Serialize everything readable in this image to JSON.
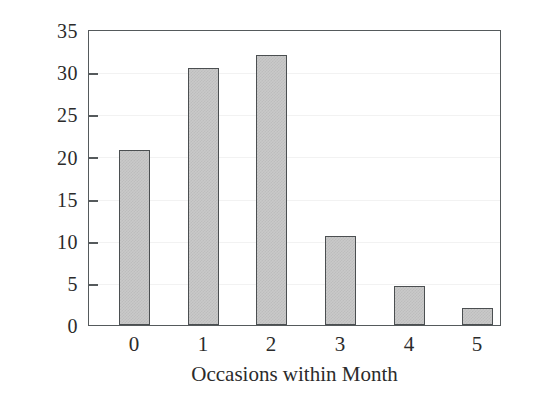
{
  "chart_data": {
    "type": "bar",
    "title": "",
    "xlabel": "Occasions within Month",
    "ylabel": "Percent",
    "categories": [
      "0",
      "1",
      "2",
      "3",
      "4",
      "5"
    ],
    "values": [
      20.9,
      30.7,
      32.3,
      10.7,
      4.7,
      2.0
    ],
    "ylim": [
      0,
      35
    ],
    "yticks": [
      0,
      5,
      10,
      15,
      20,
      25,
      30,
      35
    ],
    "ytick_labels": [
      "0",
      "5",
      "10",
      "15",
      "20",
      "25",
      "30",
      "35"
    ],
    "xtick_labels": [
      "0",
      "1",
      "2",
      "3",
      "4",
      "5"
    ],
    "grid": "faint-horizontal",
    "legend": "none",
    "bar_fill_color": "#c9c9c9",
    "bar_edge_color": "#4b4f51",
    "axis_color": "#555a5c",
    "background_color": "#ffffff",
    "text_color": "#2b2b2b"
  }
}
